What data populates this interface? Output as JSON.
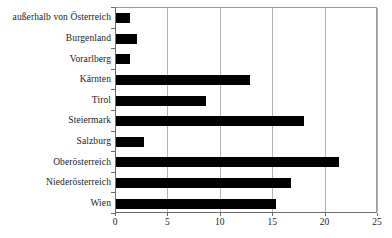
{
  "chart_data": {
    "type": "bar",
    "orientation": "horizontal",
    "title": "",
    "subtitle": "",
    "xlabel": "",
    "ylabel": "",
    "xlim": [
      0,
      25
    ],
    "xticks": [
      "0",
      "5",
      "10",
      "15",
      "20",
      "25"
    ],
    "xtick_values": [
      0,
      5,
      10,
      15,
      20,
      25
    ],
    "grid": "vertical",
    "legend": "none",
    "bar_color": "#000000",
    "gridline_color": "#b4b4b4",
    "axis_color": "#6b6b6b",
    "background_color": "#ffffff",
    "categories": [
      "außerhalb von Österreich",
      "Burgenland",
      "Vorarlberg",
      "Kärnten",
      "Tirol",
      "Steiermark",
      "Salzburg",
      "Oberösterreich",
      "Niederösterreich",
      "Wien"
    ],
    "values": [
      1.3,
      2.0,
      1.3,
      12.8,
      8.6,
      17.9,
      2.7,
      21.3,
      16.7,
      15.3
    ]
  }
}
